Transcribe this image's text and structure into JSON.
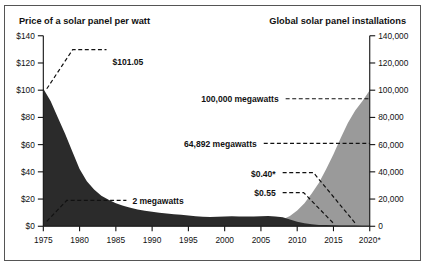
{
  "chart_data": {
    "type": "area",
    "title": "",
    "panels": [
      {
        "name": "price",
        "title": "Price of a solar panel per watt",
        "axis": "left",
        "color": "#2b2b2b",
        "ylabel": "",
        "ylim": [
          0,
          140
        ],
        "ytick_values": [
          0,
          20,
          40,
          60,
          80,
          100,
          120,
          140
        ],
        "ytick_labels": [
          "$0",
          "$20",
          "$40",
          "$60",
          "$80",
          "$100",
          "$120",
          "$140"
        ],
        "x": [
          1975,
          1976,
          1977,
          1978,
          1979,
          1980,
          1981,
          1982,
          1983,
          1984,
          1985,
          1986,
          1987,
          1988,
          1989,
          1990,
          1991,
          1992,
          1993,
          1994,
          1995,
          1996,
          1997,
          1998,
          1999,
          2000,
          2001,
          2002,
          2003,
          2004,
          2005,
          2006,
          2007,
          2008,
          2009,
          2010,
          2011,
          2012,
          2013,
          2014,
          2015,
          2016,
          2017,
          2018,
          2019,
          2020
        ],
        "values": [
          101.05,
          92.0,
          80.0,
          68.0,
          55.0,
          42.0,
          33.0,
          27.0,
          22.5,
          19.5,
          17.0,
          15.0,
          13.6,
          12.4,
          11.4,
          10.6,
          9.9,
          9.3,
          8.8,
          8.4,
          8.0,
          7.4,
          7.0,
          6.9,
          7.0,
          7.2,
          7.3,
          7.2,
          7.1,
          7.2,
          7.4,
          7.5,
          7.2,
          6.6,
          4.9,
          3.4,
          2.2,
          1.4,
          1.0,
          0.85,
          0.72,
          0.62,
          0.58,
          0.55,
          0.47,
          0.4
        ]
      },
      {
        "name": "installations",
        "title": "Global solar panel installations",
        "axis": "right",
        "color": "#9a9a9a",
        "ylabel": "",
        "ylim": [
          0,
          140000
        ],
        "ytick_values": [
          0,
          20000,
          40000,
          60000,
          80000,
          100000,
          120000,
          140000
        ],
        "ytick_labels": [
          "0",
          "20,000",
          "40,000",
          "60,000",
          "80,000",
          "100,000",
          "120,000",
          "140,000"
        ],
        "x": [
          1975,
          1976,
          1977,
          1978,
          1979,
          1980,
          1981,
          1982,
          1983,
          1984,
          1985,
          1986,
          1987,
          1988,
          1989,
          1990,
          1991,
          1992,
          1993,
          1994,
          1995,
          1996,
          1997,
          1998,
          1999,
          2000,
          2001,
          2002,
          2003,
          2004,
          2005,
          2006,
          2007,
          2008,
          2009,
          2010,
          2011,
          2012,
          2013,
          2014,
          2015,
          2016,
          2017,
          2018,
          2019,
          2020
        ],
        "values": [
          2,
          3,
          5,
          8,
          12,
          18,
          26,
          36,
          48,
          62,
          80,
          100,
          125,
          155,
          190,
          230,
          280,
          340,
          410,
          490,
          580,
          690,
          820,
          980,
          1200,
          1450,
          1750,
          2100,
          2600,
          3900,
          5400,
          7000,
          9200,
          16000,
          23500,
          40000,
          71000,
          100000,
          138000,
          178000,
          228000,
          64892,
          0,
          0,
          0,
          100000
        ]
      },
      {
        "name": "installations_display",
        "note": "rendered curve: cumulative-style rise used in figure",
        "axis": "right",
        "x": [
          1975,
          1985,
          1995,
          2000,
          2003,
          2005,
          2007,
          2008,
          2009,
          2010,
          2011,
          2012,
          2013,
          2014,
          2015,
          2016,
          2017,
          2018,
          2019,
          2020
        ],
        "values": [
          0,
          0,
          150,
          400,
          900,
          1700,
          3200,
          5000,
          7600,
          11500,
          17000,
          24000,
          32000,
          42000,
          53000,
          64892,
          76000,
          85000,
          92000,
          100000
        ]
      }
    ],
    "xlabel": "",
    "xtick_values": [
      1975,
      1980,
      1985,
      1990,
      1995,
      2000,
      2005,
      2010,
      2015,
      2020
    ],
    "xtick_labels": [
      "1975",
      "1980",
      "1985",
      "1990",
      "1995",
      "2000",
      "2005",
      "2010",
      "2015",
      "2020*"
    ],
    "xlim": [
      1975,
      2020
    ],
    "grid": false,
    "legend": "none",
    "annotations": [
      {
        "name": "price-1975",
        "label": "$101.05",
        "value": 101.05,
        "year": 1975,
        "axis": "left"
      },
      {
        "name": "installs-1975",
        "label": "2 megawatts",
        "value": 2,
        "year": 1975,
        "axis": "right"
      },
      {
        "name": "installs-2020",
        "label": "100,000 megawatts",
        "value": 100000,
        "year": 2020,
        "axis": "right"
      },
      {
        "name": "installs-2016",
        "label": "64,892 megawatts",
        "value": 64892,
        "year": 2016,
        "axis": "right"
      },
      {
        "name": "price-2020",
        "label": "$0.40*",
        "value": 0.4,
        "year": 2020,
        "axis": "left"
      },
      {
        "name": "price-2015",
        "label": "$0.55",
        "value": 0.55,
        "year": 2015,
        "axis": "left"
      }
    ]
  },
  "titles": {
    "left": "Price of a solar panel per watt",
    "right": "Global solar panel installations"
  },
  "annotation_labels": {
    "price_peak": "$101.05",
    "installs_start": "2 megawatts",
    "installs_end": "100,000 megawatts",
    "installs_mid": "64,892 megawatts",
    "price_end": "$0.40*",
    "price_near_end": "$0.55"
  },
  "colors": {
    "price_area": "#2b2b2b",
    "installations_area": "#9a9a9a",
    "axis": "#111111",
    "border": "#555555",
    "background": "#ffffff"
  }
}
